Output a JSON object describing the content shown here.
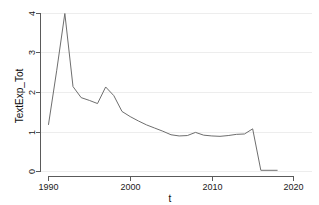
{
  "chart_data": {
    "type": "line",
    "title": "",
    "xlabel": "t",
    "ylabel": "TextExp_Tot",
    "xlim": [
      1989.2,
      2021.0
    ],
    "ylim": [
      -0.1,
      4.15
    ],
    "xticks": [
      1990,
      2000,
      2010,
      2020
    ],
    "xtick_labels": [
      "1990",
      "2000",
      "2010",
      "2020"
    ],
    "yticks": [
      0,
      1,
      2,
      3,
      4
    ],
    "ytick_labels": [
      "0",
      "1",
      "2",
      "3",
      "4"
    ],
    "grid": true,
    "grid_axis": "y",
    "legend": false,
    "line_color": "#6e6e6e",
    "background_color": "#ffffff",
    "axis_color": "#5a5a5a",
    "x": [
      1990,
      1991,
      1992,
      1993,
      1994,
      1995,
      1996,
      1997,
      1998,
      1999,
      2000,
      2001,
      2002,
      2003,
      2004,
      2005,
      2006,
      2007,
      2008,
      2009,
      2010,
      2011,
      2012,
      2013,
      2014,
      2015,
      2016,
      2017,
      2018
    ],
    "values": [
      1.19,
      2.55,
      4.0,
      2.15,
      1.87,
      1.8,
      1.72,
      2.14,
      1.92,
      1.52,
      1.39,
      1.28,
      1.18,
      1.1,
      1.02,
      0.93,
      0.9,
      0.91,
      0.99,
      0.92,
      0.9,
      0.89,
      0.91,
      0.94,
      0.95,
      1.08,
      0.03,
      0.03,
      0.03
    ],
    "series": [
      {
        "name": "TextExp_Tot",
        "values": [
          1.19,
          2.55,
          4.0,
          2.15,
          1.87,
          1.8,
          1.72,
          2.14,
          1.92,
          1.52,
          1.39,
          1.28,
          1.18,
          1.1,
          1.02,
          0.93,
          0.9,
          0.91,
          0.99,
          0.92,
          0.9,
          0.89,
          0.91,
          0.94,
          0.95,
          1.08,
          0.03,
          0.03,
          0.03
        ]
      }
    ]
  },
  "axes": {
    "y_title": "TextExp_Tot",
    "x_title": "t",
    "x_tick_0": "1990",
    "x_tick_1": "2000",
    "x_tick_2": "2010",
    "x_tick_3": "2020",
    "y_tick_0": "0",
    "y_tick_1": "1",
    "y_tick_2": "2",
    "y_tick_3": "3",
    "y_tick_4": "4"
  }
}
